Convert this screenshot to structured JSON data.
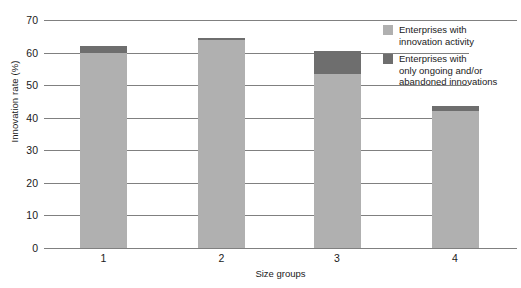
{
  "chart_data": {
    "type": "bar",
    "stacked": true,
    "title": "",
    "xlabel": "Size groups",
    "ylabel": "Innovation rate (%)",
    "categories": [
      "1",
      "2",
      "3",
      "4"
    ],
    "ylim": [
      0,
      70
    ],
    "yticks": [
      0,
      10,
      20,
      30,
      40,
      50,
      60,
      70
    ],
    "ytick_labels": [
      "0",
      "10",
      "20",
      "30",
      "40",
      "50",
      "60",
      "70"
    ],
    "grid": true,
    "legend_position": "top-right",
    "series": [
      {
        "name": "Enterprises with innovation activity",
        "color": "#b0b0b0",
        "values": [
          60.0,
          64.0,
          53.5,
          42.0
        ]
      },
      {
        "name": "Enterprises with only ongoing and/or abandoned innovations",
        "color": "#6e6e6e",
        "values": [
          2.0,
          0.5,
          7.0,
          1.5
        ]
      }
    ],
    "totals": [
      62.0,
      64.5,
      60.5,
      43.5
    ]
  },
  "axes": {
    "y_title": "Innovation rate (%)",
    "x_title": "Size groups"
  },
  "legend": {
    "items": [
      {
        "swatch_color": "#b0b0b0",
        "line1": "Enterprises with",
        "line2": "innovation activity",
        "line3": ""
      },
      {
        "swatch_color": "#6e6e6e",
        "line1": "Enterprises with",
        "line2": "only ongoing and/or",
        "line3": "abandoned innovations"
      }
    ]
  }
}
